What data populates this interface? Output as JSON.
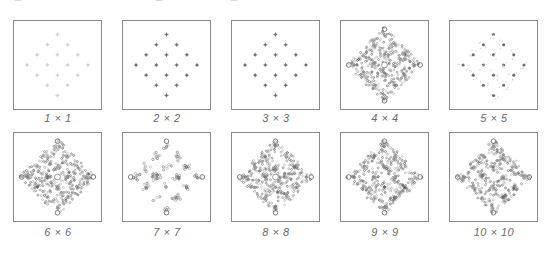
{
  "figure": {
    "panels": [
      {
        "label": "1 × 1",
        "style": "faint-dots"
      },
      {
        "label": "2 × 2",
        "style": "dots"
      },
      {
        "label": "3 × 3",
        "style": "dots"
      },
      {
        "label": "4 × 4",
        "style": "dense"
      },
      {
        "label": "5 × 5",
        "style": "sparse-lattice"
      },
      {
        "label": "6 × 6",
        "style": "dense"
      },
      {
        "label": "7 × 7",
        "style": "clusters"
      },
      {
        "label": "8 × 8",
        "style": "dense"
      },
      {
        "label": "9 × 9",
        "style": "dense-hollow"
      },
      {
        "label": "10 × 10",
        "style": "dense-hollow"
      }
    ],
    "colors": {
      "border": "#8a8a8a",
      "dot": "#6e6e6e",
      "faint": "#cfcfcf",
      "label": "#6a6a6a"
    }
  }
}
